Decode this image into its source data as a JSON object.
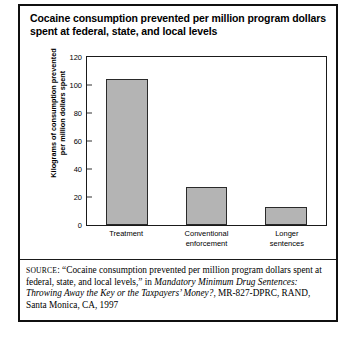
{
  "figure": {
    "title_line1": "Cocaine consumption prevented per million program dollars",
    "title_line2": "spent at federal, state, and local levels"
  },
  "chart_data": {
    "type": "bar",
    "title": "Cocaine consumption prevented per million program dollars spent at federal, state, and local levels",
    "categories": [
      "Treatment",
      "Conventional enforcement",
      "Longer sentences"
    ],
    "category_lines": [
      [
        "Treatment"
      ],
      [
        "Conventional",
        "enforcement"
      ],
      [
        "Longer",
        "sentences"
      ]
    ],
    "values": [
      104,
      27,
      13
    ],
    "xlabel": "",
    "ylabel_line1": "Kilograms of consumption prevented",
    "ylabel_line2": "per million dollars spent",
    "ylim": [
      0,
      120
    ],
    "ytick_step": 20,
    "yticks": [
      "0",
      "20",
      "40",
      "60",
      "80",
      "100",
      "120"
    ],
    "grid": false,
    "legend": "none",
    "bar_color": "#b4b4b4",
    "bar_edge_color": "#2a2a2a"
  },
  "source": {
    "label": "SOURCE",
    "text_before": ": “Cocaine consumption prevented per million program dollars spent at federal, state, and local levels,” in ",
    "italic_title": "Mandatory Minimum Drug Sentences: Throwing Away the Key or the Taxpayers’ Money?",
    "text_after": ", MR-827-DPRC, RAND, Santa Monica, CA, 1997"
  }
}
